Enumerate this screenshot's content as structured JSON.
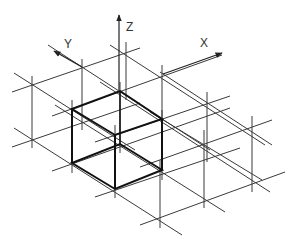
{
  "diagram": {
    "axes": [
      {
        "name": "X",
        "label": "X"
      },
      {
        "name": "Y",
        "label": "Y"
      },
      {
        "name": "Z",
        "label": "Z"
      }
    ],
    "colors": {
      "grid": "#3a3a3a",
      "cube": "#111111",
      "background": "#ffffff"
    }
  }
}
